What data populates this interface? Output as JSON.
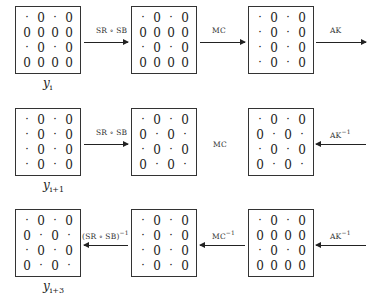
{
  "rows": [
    {
      "label_base": "y",
      "label_sub": "i",
      "matrices": [
        [
          [
            "·",
            "0",
            "·",
            "0"
          ],
          [
            "0",
            "0",
            "0",
            "0"
          ],
          [
            "·",
            "0",
            "·",
            "0"
          ],
          [
            "0",
            "0",
            "0",
            "0"
          ]
        ],
        [
          [
            "·",
            "0",
            "·",
            "0"
          ],
          [
            "0",
            "0",
            "0",
            "0"
          ],
          [
            "·",
            "0",
            "·",
            "0"
          ],
          [
            "0",
            "0",
            "0",
            "0"
          ]
        ],
        [
          [
            "·",
            "0",
            "·",
            "0"
          ],
          [
            "·",
            "0",
            "·",
            "0"
          ],
          [
            "·",
            "0",
            "·",
            "0"
          ],
          [
            "·",
            "0",
            "·",
            "0"
          ]
        ]
      ],
      "ops": [
        {
          "text": "SR ∘ SB",
          "sup": "",
          "direction": "right"
        },
        {
          "text": "MC",
          "sup": "",
          "direction": "right"
        },
        {
          "text": "AK",
          "sup": "",
          "direction": "right"
        }
      ]
    },
    {
      "label_base": "y",
      "label_sub": "i+1",
      "matrices": [
        [
          [
            "·",
            "0",
            "·",
            "0"
          ],
          [
            "·",
            "0",
            "·",
            "0"
          ],
          [
            "·",
            "0",
            "·",
            "0"
          ],
          [
            "·",
            "0",
            "·",
            "0"
          ]
        ],
        [
          [
            "·",
            "0",
            "·",
            "0"
          ],
          [
            "0",
            "·",
            "0",
            "·"
          ],
          [
            "·",
            "0",
            "·",
            "0"
          ],
          [
            "0",
            "·",
            "0",
            "·"
          ]
        ],
        [
          [
            "·",
            "0",
            "·",
            "0"
          ],
          [
            "0",
            "·",
            "0",
            "·"
          ],
          [
            "·",
            "0",
            "·",
            "0"
          ],
          [
            "0",
            "·",
            "0",
            "·"
          ]
        ]
      ],
      "ops": [
        {
          "text": "SR ∘ SB",
          "sup": "",
          "direction": "right"
        },
        {
          "text": "MC",
          "sup": "",
          "direction": "none"
        },
        {
          "text": "AK",
          "sup": "−1",
          "direction": "left"
        }
      ]
    },
    {
      "label_base": "y",
      "label_sub": "i+3",
      "matrices": [
        [
          [
            "·",
            "0",
            "·",
            "0"
          ],
          [
            "0",
            "·",
            "0",
            "·"
          ],
          [
            "·",
            "0",
            "·",
            "0"
          ],
          [
            "0",
            "·",
            "0",
            "·"
          ]
        ],
        [
          [
            "·",
            "0",
            "·",
            "0"
          ],
          [
            "·",
            "0",
            "·",
            "0"
          ],
          [
            "·",
            "0",
            "·",
            "0"
          ],
          [
            "·",
            "0",
            "·",
            "0"
          ]
        ],
        [
          [
            "·",
            "0",
            "·",
            "0"
          ],
          [
            "0",
            "0",
            "0",
            "0"
          ],
          [
            "·",
            "0",
            "·",
            "0"
          ],
          [
            "0",
            "0",
            "0",
            "0"
          ]
        ]
      ],
      "ops": [
        {
          "text": "(SR ∘ SB)",
          "sup": "−1",
          "direction": "left"
        },
        {
          "text": "MC",
          "sup": "−1",
          "direction": "left"
        },
        {
          "text": "AK",
          "sup": "−1",
          "direction": "left"
        }
      ]
    }
  ]
}
